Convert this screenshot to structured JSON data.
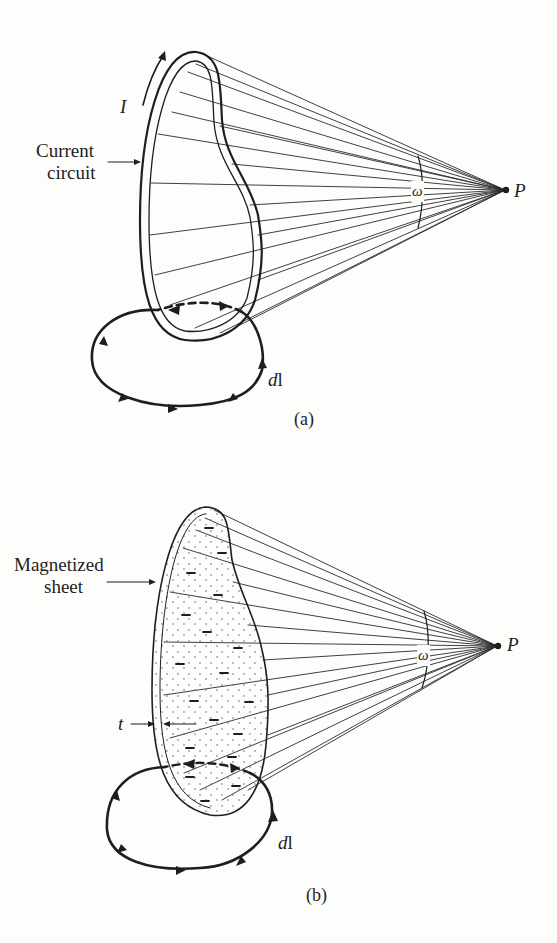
{
  "figure_a": {
    "caption": "(a)",
    "label_current_circuit_line1": "Current",
    "label_current_circuit_line2": "circuit",
    "label_current": "I",
    "label_solid_angle": "ω",
    "label_point": "P",
    "label_line_element": "dl",
    "line_element_prefix": "d",
    "line_element_suffix": "l"
  },
  "figure_b": {
    "caption": "(b)",
    "label_sheet_line1": "Magnetized",
    "label_sheet_line2": "sheet",
    "label_thickness": "t",
    "label_solid_angle": "ω",
    "label_point": "P",
    "line_element_prefix": "d",
    "line_element_suffix": "l",
    "surface_charge_sign": "−"
  },
  "colors": {
    "ink": "#1e1e1e",
    "paper": "#fdfdfc",
    "stipple": "#6a6a6a"
  }
}
